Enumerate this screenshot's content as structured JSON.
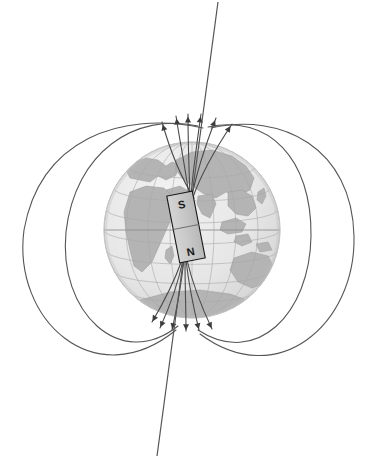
{
  "figure": {
    "name": "earth-magnetic-field-diagram",
    "background_color": "#ffffff",
    "line_color": "#555555",
    "canvas": {
      "width": 373,
      "height": 464
    }
  },
  "globe": {
    "name": "earth-globe",
    "center_x": 192,
    "center_y": 230,
    "radius": 88,
    "ocean_color": "#e8e8e8",
    "land_color": "#b4b4b4",
    "grid_color": "#aaaaaa",
    "outline_color": "#cccccc",
    "graticule": {
      "parallels": 7,
      "meridians": 9,
      "equator_visible": true
    },
    "landmasses": [
      "Africa",
      "Europe",
      "Asia",
      "Middle East",
      "India",
      "Southeast Asia",
      "Australia",
      "Antarctica"
    ]
  },
  "magnet": {
    "name": "bar-magnet",
    "tilt_degrees": -11,
    "center_x": 186,
    "center_y": 227,
    "width": 26,
    "height": 68,
    "fill_color": "#c8c8c8",
    "stroke_color": "#1a1a1a",
    "top_pole_label": "S",
    "bottom_pole_label": "N",
    "top_pole_name": "south-magnetic-pole-of-magnet",
    "bottom_pole_name": "north-magnetic-pole-of-magnet",
    "divider_visible": true
  },
  "magnetic_axis": {
    "name": "magnetic-axis-line",
    "x1": 218,
    "y1": 2,
    "x2": 157,
    "y2": 456,
    "color": "#555555",
    "width": 1.2
  },
  "field_lines": {
    "name": "magnetic-field-lines",
    "direction_note": "Arrows point into the northern pole at top and away from the southern pole at bottom",
    "outer_loops": [
      {
        "id": "outer-loop-left-1",
        "side": "left",
        "extent": 170
      },
      {
        "id": "outer-loop-left-2",
        "side": "left",
        "extent": 118
      },
      {
        "id": "outer-loop-right-1",
        "side": "right",
        "extent": 170
      },
      {
        "id": "outer-loop-right-2",
        "side": "right",
        "extent": 118
      }
    ],
    "inner_lines_top_count": 6,
    "inner_lines_bottom_count": 6,
    "arrowhead_count_top": 6,
    "arrowhead_count_bottom": 6,
    "stroke_width": 1.1
  }
}
